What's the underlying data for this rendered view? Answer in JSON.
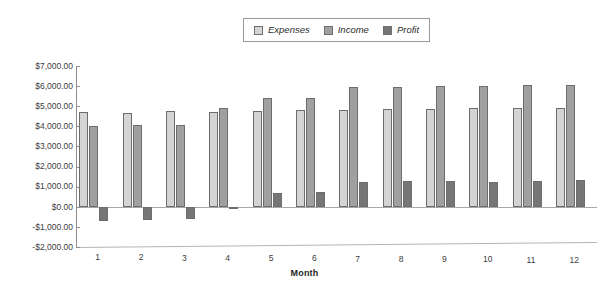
{
  "chart_data": {
    "type": "bar",
    "title": "",
    "xlabel": "Month",
    "ylabel": "",
    "categories": [
      "1",
      "2",
      "3",
      "4",
      "5",
      "6",
      "7",
      "8",
      "9",
      "10",
      "11",
      "12"
    ],
    "series": [
      {
        "name": "Expenses",
        "color": "#d4d4d4",
        "values": [
          4700,
          4680,
          4750,
          4720,
          4780,
          4800,
          4810,
          4840,
          4870,
          4890,
          4930,
          4900
        ]
      },
      {
        "name": "Income",
        "color": "#a0a0a0",
        "values": [
          4000,
          4050,
          4060,
          4890,
          5400,
          5400,
          5940,
          5970,
          6000,
          6000,
          6050,
          6060
        ]
      },
      {
        "name": "Profit",
        "color": "#767676",
        "values": [
          -700,
          -680,
          -620,
          -100,
          700,
          740,
          1250,
          1260,
          1280,
          1250,
          1300,
          1320
        ]
      }
    ],
    "ylim": [
      -2000,
      7000
    ],
    "y_ticks": [
      7000,
      6000,
      5000,
      4000,
      3000,
      2000,
      1000,
      0,
      -1000,
      -2000
    ],
    "y_tick_labels": [
      "$7,000.00",
      "$6,000.00",
      "$5,000.00",
      "$4,000.00",
      "$3,000.00",
      "$2,000.00",
      "$1,000.00",
      "$0.00",
      "-$1,000.00",
      "-$2,000.00"
    ],
    "grid": false,
    "legend_position": "top-center",
    "legend": [
      "Expenses",
      "Income",
      "Profit"
    ]
  }
}
